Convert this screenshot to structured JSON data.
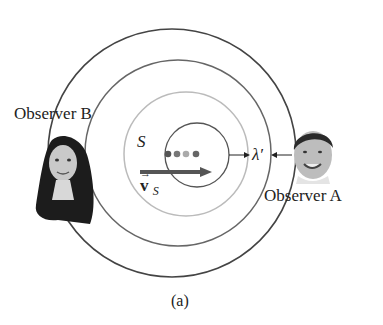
{
  "figure": {
    "caption": "(a)",
    "source_label": "S",
    "velocity_label": "v",
    "velocity_subscript": "S",
    "wavelength_label": "λ′",
    "observer_a_label": "Observer A",
    "observer_b_label": "Observer B"
  },
  "colors": {
    "outer_circle": "#444444",
    "middle_circle": "#666666",
    "inner_light_circle": "#bbbbbb",
    "innermost_circle": "#555555",
    "arrow": "#555555",
    "dots": [
      "#555555",
      "#777777",
      "#aaaaaa",
      "#666666"
    ]
  }
}
